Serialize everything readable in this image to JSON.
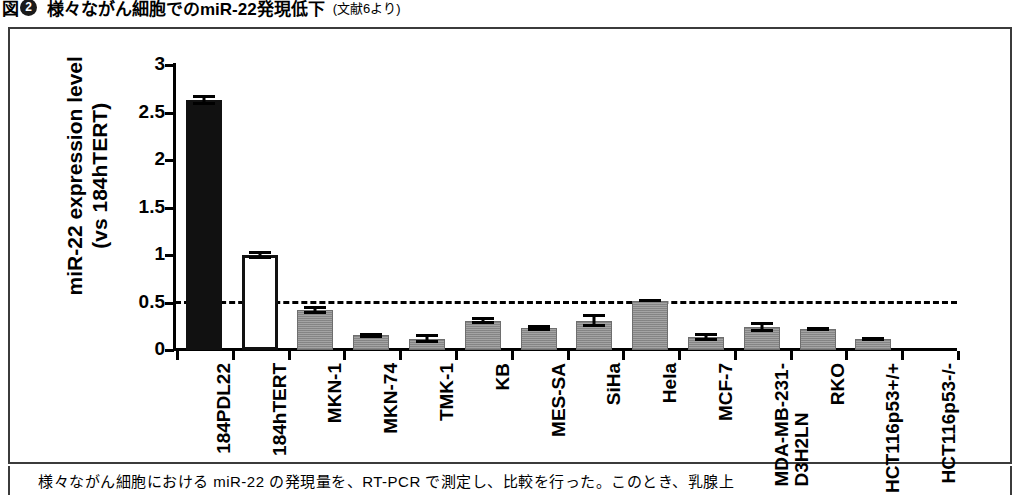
{
  "figure": {
    "number_label": "図",
    "number_badge": "2",
    "title": "様々ながん細胞でのmiR-22発現低下",
    "source": "(文献6より)",
    "caption": "様々ながん細胞における miR-22 の発現量を、RT-PCR で測定し、比較を行った。このとき、乳腺上"
  },
  "chart_data": {
    "type": "bar",
    "title": "様々ながん細胞でのmiR-22発現低下",
    "xlabel": "",
    "ylabel": "miR-22 expression level (vs 184hTERT)",
    "ylim": [
      0,
      3
    ],
    "yticks": [
      "0",
      "0.5",
      "1",
      "1.5",
      "2",
      "2.5",
      "3"
    ],
    "ytick_values": [
      0,
      0.5,
      1,
      1.5,
      2,
      2.5,
      3
    ],
    "grid": false,
    "legend": "none",
    "reference_line": {
      "value": 0.52,
      "style": "dashed",
      "color": "#000000"
    },
    "categories": [
      "184PDL22",
      "184hTERT",
      "MKN-1",
      "MKN-74",
      "TMK-1",
      "KB",
      "MES-SA",
      "SiHa",
      "Hela",
      "MCF-7",
      "MDA-MB-231-D3H2LN",
      "RKO",
      "HCT116p53+/+",
      "HCT116p53-/-"
    ],
    "category_lines": [
      [
        "184PDL22"
      ],
      [
        "184hTERT"
      ],
      [
        "MKN-1"
      ],
      [
        "MKN-74"
      ],
      [
        "TMK-1"
      ],
      [
        "KB"
      ],
      [
        "MES-SA"
      ],
      [
        "SiHa"
      ],
      [
        "Hela"
      ],
      [
        "MCF-7"
      ],
      [
        "MDA-MB-231-",
        "D3H2LN"
      ],
      [
        "RKO"
      ],
      [
        "HCT116p53+/+"
      ],
      [
        "HCT116p53-/-"
      ]
    ],
    "values": [
      2.63,
      1.0,
      0.42,
      0.155,
      0.12,
      0.31,
      0.23,
      0.31,
      0.52,
      0.135,
      0.245,
      0.225,
      0.115,
      0.0
    ],
    "errors": [
      0.055,
      0.045,
      0.045,
      0.025,
      0.045,
      0.035,
      0.035,
      0.065,
      0.015,
      0.04,
      0.055,
      0.02,
      0.025,
      0.0
    ],
    "bar_styles": [
      "black",
      "white",
      "gray",
      "gray",
      "gray",
      "gray",
      "gray",
      "gray",
      "gray",
      "gray",
      "gray",
      "gray",
      "gray",
      "gray"
    ],
    "colors": {
      "black_bar": "#111111",
      "white_bar": "#ffffff",
      "gray_bar": "#9a9a9a",
      "axis": "#000000"
    }
  }
}
